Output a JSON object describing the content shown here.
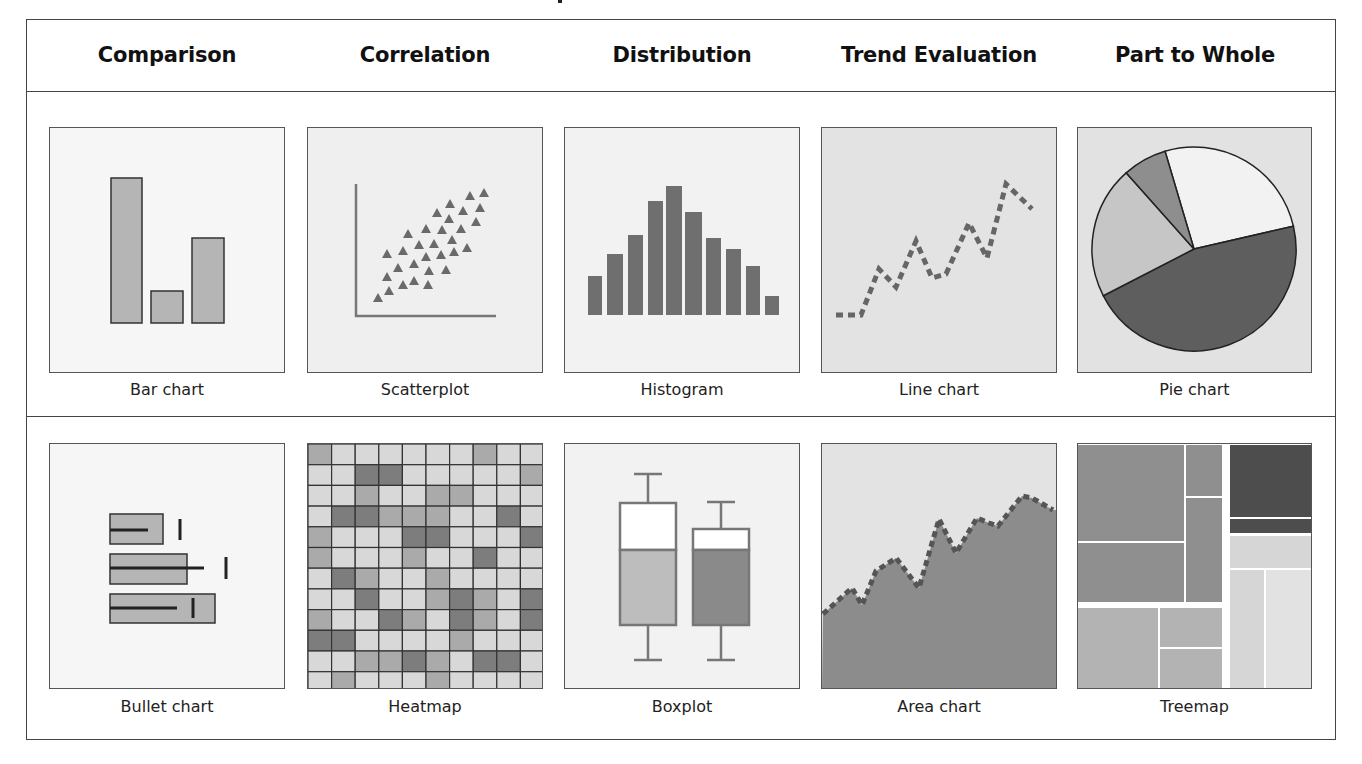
{
  "headers": [
    "Comparison",
    "Correlation",
    "Distribution",
    "Trend Evaluation",
    "Part to Whole"
  ],
  "captions": {
    "row1": [
      "Bar chart",
      "Scatterplot",
      "Histogram",
      "Line chart",
      "Pie chart"
    ],
    "row2": [
      "Bullet chart",
      "Heatmap",
      "Boxplot",
      "Area chart",
      "Treemap"
    ]
  },
  "colors": {
    "frame": "#444444",
    "bar_fill": "#b5b5b5",
    "dark_fill": "#6e6e6e",
    "marker": "#6a6a6a",
    "panel_bg_light": "#f4f4f4",
    "panel_bg_mid": "#e4e4e4"
  },
  "chart_data": [
    {
      "type": "bar",
      "name": "Bar chart",
      "categories": [
        "A",
        "B",
        "C"
      ],
      "values": [
        145,
        32,
        85
      ],
      "ylim": [
        0,
        160
      ]
    },
    {
      "type": "scatter",
      "name": "Scatterplot",
      "points": [
        [
          377,
          297
        ],
        [
          388,
          290
        ],
        [
          386,
          276
        ],
        [
          386,
          253
        ],
        [
          397,
          267
        ],
        [
          402,
          284
        ],
        [
          402,
          250
        ],
        [
          407,
          233
        ],
        [
          413,
          280
        ],
        [
          413,
          263
        ],
        [
          418,
          244
        ],
        [
          425,
          228
        ],
        [
          425,
          256
        ],
        [
          427,
          284
        ],
        [
          428,
          270
        ],
        [
          433,
          243
        ],
        [
          436,
          212
        ],
        [
          440,
          254
        ],
        [
          441,
          229
        ],
        [
          445,
          269
        ],
        [
          448,
          218
        ],
        [
          449,
          203
        ],
        [
          451,
          239
        ],
        [
          453,
          251
        ],
        [
          460,
          228
        ],
        [
          462,
          210
        ],
        [
          466,
          247
        ],
        [
          469,
          195
        ],
        [
          475,
          221
        ],
        [
          479,
          207
        ],
        [
          483,
          192
        ]
      ]
    },
    {
      "type": "bar",
      "name": "Histogram",
      "categories": [
        "1",
        "2",
        "3",
        "4",
        "5",
        "6",
        "7",
        "8",
        "9",
        "10"
      ],
      "values": [
        39,
        61,
        80,
        114,
        129,
        103,
        77,
        66,
        49,
        19
      ]
    },
    {
      "type": "line",
      "name": "Line chart",
      "x": [
        835,
        860,
        878,
        895,
        915,
        931,
        945,
        968,
        986,
        1005,
        1031
      ],
      "y": [
        314,
        314,
        268,
        286,
        240,
        277,
        273,
        222,
        257,
        183,
        208
      ]
    },
    {
      "type": "pie",
      "name": "Pie chart",
      "slices": [
        {
          "label": "light",
          "value": 26
        },
        {
          "label": "dark",
          "value": 46
        },
        {
          "label": "light-gray",
          "value": 21
        },
        {
          "label": "mid-gray",
          "value": 7
        }
      ]
    },
    {
      "type": "bar",
      "name": "Bullet chart",
      "orientation": "horizontal",
      "rows": [
        {
          "range": 53,
          "measure": 38,
          "target": 70
        },
        {
          "range": 77,
          "measure": 94,
          "target": 116
        },
        {
          "range": 105,
          "measure": 67,
          "target": 83
        }
      ]
    },
    {
      "type": "heatmap",
      "name": "Heatmap",
      "levels": [
        [
          1,
          0,
          0,
          0,
          0,
          0,
          0,
          1,
          0,
          0
        ],
        [
          0,
          0,
          2,
          2,
          0,
          0,
          0,
          0,
          0,
          1
        ],
        [
          0,
          0,
          1,
          0,
          0,
          1,
          1,
          0,
          0,
          0
        ],
        [
          0,
          2,
          2,
          1,
          1,
          1,
          0,
          0,
          2,
          0
        ],
        [
          1,
          0,
          0,
          0,
          2,
          2,
          0,
          0,
          0,
          2
        ],
        [
          1,
          0,
          0,
          0,
          1,
          0,
          0,
          2,
          0,
          0
        ],
        [
          0,
          2,
          1,
          0,
          0,
          1,
          0,
          0,
          0,
          0
        ],
        [
          0,
          0,
          2,
          0,
          0,
          1,
          2,
          1,
          0,
          2
        ],
        [
          1,
          0,
          0,
          2,
          1,
          0,
          2,
          1,
          0,
          2
        ],
        [
          2,
          2,
          0,
          0,
          0,
          0,
          1,
          0,
          0,
          0
        ],
        [
          0,
          0,
          1,
          1,
          2,
          1,
          0,
          2,
          2,
          0
        ],
        [
          0,
          1,
          0,
          0,
          0,
          1,
          0,
          0,
          0,
          0
        ]
      ]
    },
    {
      "type": "table",
      "name": "Boxplot",
      "boxes": [
        {
          "whisker_top": 473,
          "q3": 502,
          "median": 549,
          "q1": 624,
          "whisker_bottom": 659
        },
        {
          "whisker_top": 501,
          "q3": 528,
          "median": 549,
          "q1": 624,
          "whisker_bottom": 659
        }
      ]
    },
    {
      "type": "area",
      "name": "Area chart",
      "x": [
        822,
        851,
        861,
        875,
        895,
        918,
        938,
        955,
        976,
        988,
        997,
        1021,
        1031,
        1052
      ],
      "y": [
        613,
        587,
        604,
        570,
        557,
        587,
        518,
        552,
        517,
        522,
        525,
        495,
        497,
        509
      ]
    },
    {
      "type": "table",
      "name": "Treemap",
      "rects": [
        {
          "x": 1077,
          "y": 444,
          "w": 106,
          "h": 96,
          "shade": "mid"
        },
        {
          "x": 1077,
          "y": 542,
          "w": 106,
          "h": 59,
          "shade": "mid"
        },
        {
          "x": 1185,
          "y": 444,
          "w": 36,
          "h": 51,
          "shade": "mid"
        },
        {
          "x": 1185,
          "y": 497,
          "w": 36,
          "h": 104,
          "shade": "mid"
        },
        {
          "x": 1077,
          "y": 607,
          "w": 80,
          "h": 80,
          "shade": "light"
        },
        {
          "x": 1159,
          "y": 607,
          "w": 62,
          "h": 39,
          "shade": "light"
        },
        {
          "x": 1159,
          "y": 648,
          "w": 62,
          "h": 39,
          "shade": "light"
        },
        {
          "x": 1229,
          "y": 444,
          "w": 82,
          "h": 72,
          "shade": "dark"
        },
        {
          "x": 1229,
          "y": 518,
          "w": 82,
          "h": 14,
          "shade": "dark"
        },
        {
          "x": 1229,
          "y": 535,
          "w": 82,
          "h": 32,
          "shade": "pale"
        },
        {
          "x": 1229,
          "y": 569,
          "w": 34,
          "h": 118,
          "shade": "pale"
        },
        {
          "x": 1265,
          "y": 569,
          "w": 46,
          "h": 118,
          "shade": "paler"
        }
      ]
    }
  ]
}
